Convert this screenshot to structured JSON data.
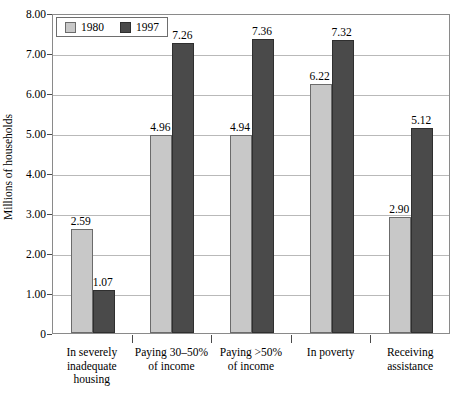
{
  "chart_data": {
    "type": "bar",
    "title": "",
    "xlabel": "",
    "ylabel": "Millions of households",
    "ylim": [
      0,
      8
    ],
    "ytick_labels": [
      "0",
      "1.00",
      "2.00",
      "3.00",
      "4.00",
      "5.00",
      "6.00",
      "7.00",
      "8.00"
    ],
    "ytick_values": [
      0,
      1,
      2,
      3,
      4,
      5,
      6,
      7,
      8
    ],
    "grid": true,
    "legend_position": "top-left",
    "categories": [
      "In severely\ninadequate\nhousing",
      "Paying 30–50%\nof income",
      "Paying >50%\nof income",
      "In poverty",
      "Receiving\nassistance"
    ],
    "series": [
      {
        "name": "1980",
        "color": "#c8c8c8",
        "values": [
          2.59,
          4.96,
          4.94,
          6.22,
          2.9
        ],
        "labels": [
          "2.59",
          "4.96",
          "4.94",
          "6.22",
          "2.90"
        ]
      },
      {
        "name": "1997",
        "color": "#4a4a4a",
        "values": [
          1.07,
          7.26,
          7.36,
          7.32,
          5.12
        ],
        "labels": [
          "1.07",
          "7.26",
          "7.36",
          "7.32",
          "5.12"
        ]
      }
    ]
  },
  "legend": {
    "entries": [
      {
        "label": "1980",
        "swatch": "legend-swatch-1980"
      },
      {
        "label": "1997",
        "swatch": "legend-swatch-1997"
      }
    ]
  },
  "colors": {
    "series_1980": "#c8c8c8",
    "series_1997": "#4a4a4a",
    "gridline": "#b9b9b9",
    "frame": "#8a8a8a",
    "text": "#000000",
    "background": "#ffffff"
  }
}
